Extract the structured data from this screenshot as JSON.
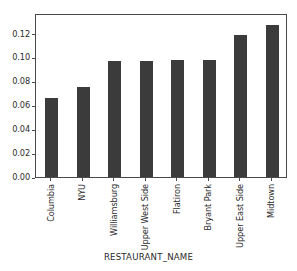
{
  "chart_data": {
    "type": "bar",
    "title": "",
    "xlabel": "RESTAURANT_NAME",
    "ylabel": "",
    "categories": [
      "Columbia",
      "NYU",
      "Williamsburg",
      "Upper West Side",
      "Flatiron",
      "Bryant Park",
      "Upper East Side",
      "Midtown"
    ],
    "values": [
      0.0665,
      0.0757,
      0.0968,
      0.0972,
      0.0982,
      0.0982,
      0.1185,
      0.127
    ],
    "ylim": [
      0.0,
      0.1372
    ],
    "yticks": [
      0.0,
      0.02,
      0.04,
      0.06,
      0.08,
      0.1,
      0.12
    ],
    "ytick_labels": [
      "0.00",
      "0.02",
      "0.04",
      "0.06",
      "0.08",
      "0.10",
      "0.12"
    ],
    "grid": false,
    "legend": null,
    "bar_color": "#3b3b3b",
    "axis_color": "#4a4a4a",
    "background_color": "#ffffff",
    "xtick_rotation": 90
  }
}
